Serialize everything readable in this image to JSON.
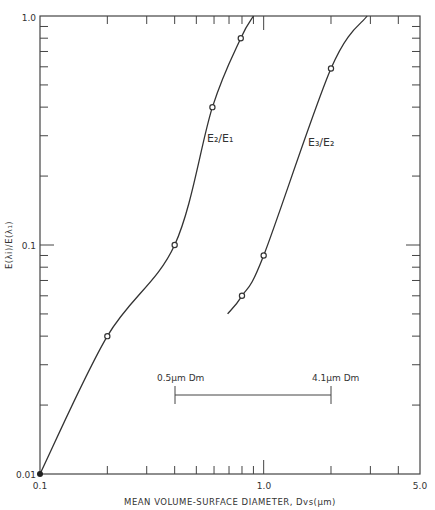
{
  "chart_data": {
    "type": "line",
    "title": "",
    "xlabel": "MEAN VOLUME-SURFACE DIAMETER, Dvs(μm)",
    "ylabel": "E(λi)/E(λ₁)",
    "xscale": "log",
    "yscale": "log",
    "xlim": [
      0.1,
      5.0
    ],
    "ylim": [
      0.01,
      1.0
    ],
    "x_tick_labels": [
      "0.1",
      "1.0",
      "5.0"
    ],
    "y_tick_labels": [
      "0.01",
      "0.1",
      "1.0"
    ],
    "grid": false,
    "legend": null,
    "series": [
      {
        "name": "E2/E1",
        "label": "E₂/E₁",
        "points": [
          {
            "x": 0.1,
            "y": 0.01
          },
          {
            "x": 0.2,
            "y": 0.04
          },
          {
            "x": 0.4,
            "y": 0.1
          },
          {
            "x": 0.59,
            "y": 0.4
          },
          {
            "x": 0.79,
            "y": 0.8
          }
        ],
        "curve_extends_to": {
          "x": 0.9,
          "y": 1.0
        }
      },
      {
        "name": "E3/E2",
        "label": "E₃/E₂",
        "points": [
          {
            "x": 0.8,
            "y": 0.06
          },
          {
            "x": 1.0,
            "y": 0.09
          },
          {
            "x": 2.0,
            "y": 0.59
          }
        ],
        "curve_starts_at": {
          "x": 0.69,
          "y": 0.05
        },
        "curve_extends_to": {
          "x": 2.9,
          "y": 1.0
        }
      }
    ],
    "annotations": [
      {
        "text": "0.5μm Dm",
        "x": 0.4,
        "y": 0.023
      },
      {
        "text": "4.1μm Dm",
        "x": 2.0,
        "y": 0.023
      },
      {
        "type": "range_bar",
        "x_from": 0.4,
        "x_to": 2.0,
        "y": 0.02
      }
    ]
  },
  "labels": {
    "y_top": "1.0",
    "y_mid": "0.1",
    "y_bot": "0.01",
    "x_left": "0.1",
    "x_mid": "1.0",
    "x_right": "5.0",
    "xlabel": "MEAN VOLUME-SURFACE DIAMETER, Dvs(μm)",
    "ylabel": "E(λi)/E(λ₁)",
    "series1": "E₂/E₁",
    "series2": "E₃/E₂",
    "ann_left": "0.5μm Dm",
    "ann_right": "4.1μm Dm"
  },
  "colors": {
    "line": "#333333",
    "background": "#ffffff"
  }
}
